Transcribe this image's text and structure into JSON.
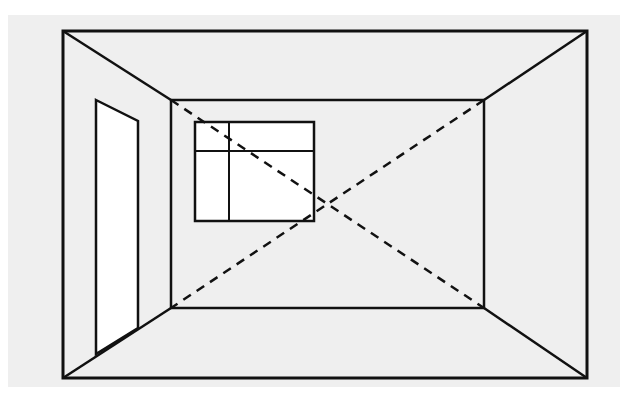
{
  "diagram": {
    "background_color": "#ffffff",
    "panel_color": "#efefef",
    "stroke_color": "#111111",
    "fill_white": "#ffffff",
    "panel": {
      "x": 8,
      "y": 15,
      "w": 612,
      "h": 372
    },
    "outer_frame": {
      "x1": 63,
      "y1": 31,
      "x2": 587,
      "y2": 378
    },
    "back_wall": {
      "x1": 171,
      "y1": 100,
      "x2": 484,
      "y2": 308
    },
    "door": {
      "points": "96,100 138,121 138,328 96,354"
    },
    "window": {
      "x": 195,
      "y": 122,
      "w": 119,
      "h": 99,
      "mullion_x": 229,
      "transom_y": 151
    },
    "diagonals": [
      {
        "x1": 171,
        "y1": 100,
        "x2": 484,
        "y2": 308
      },
      {
        "x1": 484,
        "y1": 100,
        "x2": 171,
        "y2": 308
      }
    ]
  }
}
